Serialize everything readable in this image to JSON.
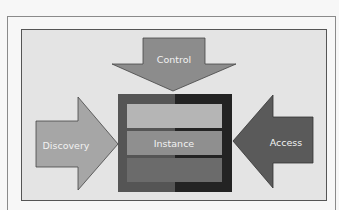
{
  "diagram": {
    "nodes": {
      "control": {
        "label": "Control",
        "color": "#8c8c8c"
      },
      "discovery": {
        "label": "Discovery",
        "color": "#a6a6a6"
      },
      "access": {
        "label": "Access",
        "color": "#5a5a5a"
      },
      "instance": {
        "label": "Instance",
        "frame_left_color": "#555555",
        "frame_right_color": "#232323",
        "layers": [
          {
            "color": "#b5b5b5"
          },
          {
            "color": "#8f8f8f"
          },
          {
            "color": "#6b6b6b"
          }
        ]
      }
    },
    "edges": [
      {
        "from": "control",
        "to": "instance",
        "direction": "down"
      },
      {
        "from": "discovery",
        "to": "instance",
        "direction": "right"
      },
      {
        "from": "access",
        "to": "instance",
        "direction": "left"
      }
    ],
    "panel_background": "#e4e4e4"
  }
}
